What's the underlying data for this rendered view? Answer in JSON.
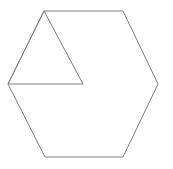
{
  "canvas": {
    "width": 173,
    "height": 169,
    "background_color": "#ffffff",
    "description": "Line drawing of a regular hexagon with an inscribed triangle in its upper-left region"
  },
  "figure": {
    "stroke_color": "#7f7f7f",
    "stroke_width": 1,
    "fill": "none",
    "shapes": [
      {
        "name": "hexagon",
        "sides": 6,
        "points": "44,11 123,11 158,84 123,157 45,157 8,84",
        "vertices": [
          {
            "label": "top-left",
            "x": 44,
            "y": 11
          },
          {
            "label": "top-right",
            "x": 123,
            "y": 11
          },
          {
            "label": "right",
            "x": 158,
            "y": 84
          },
          {
            "label": "bottom-right",
            "x": 123,
            "y": 157
          },
          {
            "label": "bottom-left",
            "x": 45,
            "y": 157
          },
          {
            "label": "left",
            "x": 8,
            "y": 84
          }
        ]
      },
      {
        "name": "triangle",
        "sides": 3,
        "points": "44,11 83,84 8,84",
        "vertices": [
          {
            "label": "apex",
            "x": 44,
            "y": 11
          },
          {
            "label": "bottom-right",
            "x": 83,
            "y": 84
          },
          {
            "label": "bottom-left",
            "x": 8,
            "y": 84
          }
        ]
      }
    ]
  }
}
